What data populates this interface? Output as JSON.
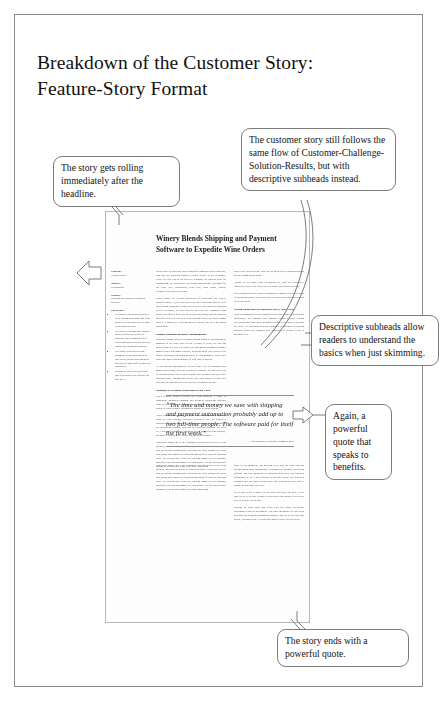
{
  "figure": {
    "title_line1": "Breakdown of the Customer Story:",
    "title_line2": "Feature-Story Format"
  },
  "callouts": [
    {
      "id": "headline",
      "text": "The story gets rolling immediately after the headline.",
      "points_to": "document-headline"
    },
    {
      "id": "flow",
      "text": "The customer story still follows the same flow of Customer-Challenge-Solution-Results, but with descriptive subheads instead.",
      "points_to": "document-body-subheads"
    },
    {
      "id": "subheads",
      "text": "Descriptive subheads allow readers to understand the basics when just skimming.",
      "points_to": "document-subhead-right"
    },
    {
      "id": "quote2",
      "text": "Again, a powerful quote that speaks to benefits.",
      "points_to": "document-pull-quote"
    },
    {
      "id": "endquote",
      "text": "The story ends with a powerful quote.",
      "points_to": "document-closing-quote"
    }
  ],
  "document": {
    "headline": "Winery Blends Shipping and Payment Software to Expedite Wine Orders",
    "sidebar": [
      {
        "heading": "Company:",
        "body": "Oregon Winery"
      },
      {
        "heading": "Industry:",
        "body": "Winemaking"
      },
      {
        "heading": "Solution:",
        "body": "Shipping and payment automation software"
      },
      {
        "heading": "The Results:",
        "body": ""
      }
    ],
    "sidebar_bullets": [
      "The winery was marked orders as extra-costing processing time from phone to release down to less than 30 seconds per order.",
      "The ability to run multiple charges in now allowed the winery to negotiate lower transaction fees with its merchant services provider, which saves thousands annually.",
      "The winery projects that club shipments in less than instead of two weeks, and avoided having to add two full-time staff to handle the club orders.",
      "Savings on labor costs and credit card fees paid for the software the first week."
    ],
    "columns": {
      "left": [
        "With a spirit of adventure and a passion for making world-class wine, Bob and Sue Sorensen founded Oregon Winery in the Willamette Valley in 1996. Part of the fun is to recognize the region's value for winemaking; the winemaker Jon became meticulously acclaimed for the Pinot Noir, Chardonnay, Pinot Gris, Pinot Blanc, Sirrahs, Grenache and Merlot Riesling.",
        "Today, under the second generation of leadership, the winery produces about 13,000 cases per year and is growing quickly. With three tasting rooms and a wine club in an on-road business expanding to over 60 states, the case load for the year, the company's team needed an efficient way to keep up with increasing, specific inquiries and preferences, as well as to keep tracking orders, the winery might scale if it adapted to a day during low season, and up to 40 during high season."
      ],
      "left_subhead_1": "Manual Shipping Becomes Unmanageable",
      "left_body_2": [
        "Shipping volume touches its highest during quarterly distributions to members of the wine club. In just a couple of years, the club has grown from 95 to 900. Previously, the winemaker struggled through a manual order fulfillment process, spending about two weeks every quarter preparing and shipping orders to club members. Each order could take more than 45 minutes of staff time to process.",
        "'It was getting unmanageable to have just a bit of customers and manual processing,' said Sue Sorensen, President. 'We just took a lot of customers daily and we used to make sure no more than twice on a personal basis, remembering details like what kinds of wines they like, and entering that they received their shipments on time.'"
      ],
      "left_subhead_2": "Shipping & Payment Processing in One Click",
      "left_body_3": [
        "When Oregon Winery selected the CRM solution, it chose to implement integrated shipping and payment processing software from WSD Software to expedite order fulfillment. Now it's just a couple of clicks to move information across the whole system.",
        "'There are tons of products out there that are custom-made for your clubs or POS systems,' Sorensen explained. 'But we wanted a solution that would integrate with everything else we were doing off our accounting systems, web orders, CRM and shipping. We liked TCA because because they integrate nicely with our CRM software, and make it perfect to get orders out and credit charges.'",
        "Employees simply go to the customer's account record in the CRM software, and with the click of a button the order is processed end-to-end; the system automatically calculates the total, charges the credit card using, and triggers the shipping application to print the shipping label. The system also recalls the tracking number to the customer and writes the tracking number to CRM history. All this processing is automatic, and the user triggers the order generating"
      ],
      "right": [
        "back to the CRM system. There are no steps to keep running through and no coding and printing.",
        "'Thanks to the tight CRM integration, the staff are productive. Employees can see the order list or at home two person operation.'",
        "Sue Sorensen says the team has dramatically improved with the speed of processing orders; they don't have to worry about lost orders when it's needed issue.",
        "More at 300 members, and growing every day, the wine club has become much more manageable. Shipping and payment processing software lag now measured as shipping preferences and financial information in the CRM software to provide orders. Sue Sorensen estimates that the winery would have had to bring on extra staff to handle the growing wine club.",
        "'We're able to get a handle on our wine club now,' she said. 'Every time we do it, the day is larger: What used to take maybe two weeks, now we can do in two days.'",
        "Savings on labor costs and credit card fees drove an instant investment return on investment. 'The time and money we save with shipping and payment automation probably add up to two full-time people,' Sorensen said. 'The software paid for itself the first week.'"
      ],
      "right_subhead_1": "Saving Thousands on Merchant Fees, Labor Costs",
      "right_subhead_1_body": "With an automated process handling credit card charges and shipping preferences, the company now multiple orders at once, cutting processing time from about 45 minutes down to less than 30 seconds per order. The merchant services supported by payment processing software helped the company save thousands of dollars a year in merchant fees."
    },
    "pull_quote": "“The time and money we save with shipping and payment automation probably add up to two full-time people. The software paid for itself the first week.”",
    "pull_quote_attribution": "—Sue Sorensen, President, Oregon Winery"
  }
}
